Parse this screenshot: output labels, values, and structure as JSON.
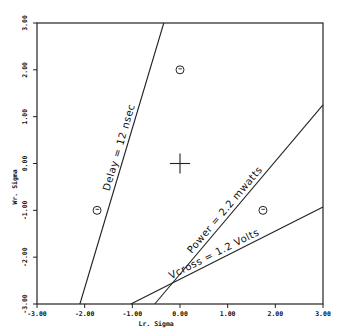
{
  "chart_data": {
    "type": "line",
    "title": "",
    "xlabel": "Lr. Sigma",
    "ylabel": "Wr. Sigma",
    "xlim": [
      -3,
      3
    ],
    "ylim": [
      -3,
      3
    ],
    "grid": false,
    "x_ticks": [
      "-3.00",
      "-2.00",
      "-1.00",
      "0.00",
      "1.00",
      "2.00",
      "3.00"
    ],
    "y_ticks": [
      "-3.00",
      "-2.00",
      "-1.00",
      "0.00",
      "1.00",
      "2.00",
      "3.00"
    ],
    "series": [
      {
        "name": "Delay = 12 nsec",
        "x": [
          -2.1,
          -0.34
        ],
        "y": [
          -3.0,
          3.0
        ]
      },
      {
        "name": "Power = 2.2 mwatts",
        "x": [
          -0.53,
          3.0
        ],
        "y": [
          -3.0,
          1.25
        ]
      },
      {
        "name": "Vcross = 1.2 Volts",
        "x": [
          -1.03,
          3.0
        ],
        "y": [
          -3.0,
          -0.93
        ]
      }
    ],
    "markers": {
      "nominal_cross": {
        "x": 0.0,
        "y": 0.0
      },
      "circles": [
        {
          "x": 0.0,
          "y": 2.0
        },
        {
          "x": -1.74,
          "y": -1.0
        },
        {
          "x": 1.74,
          "y": -1.0
        }
      ]
    },
    "annotations": [
      "Delay = 12 nsec",
      "Power = 2.2 mwatts",
      "Vcross = 1.2 Volts"
    ]
  }
}
